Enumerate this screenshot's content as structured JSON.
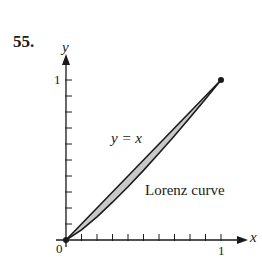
{
  "problem_number": "55.",
  "chart_data": {
    "type": "line",
    "title": "",
    "xlabel": "x",
    "ylabel": "y",
    "xlim": [
      0,
      1
    ],
    "ylim": [
      0,
      1
    ],
    "grid": false,
    "x_ticks": {
      "count": 10,
      "step": 0.1,
      "labels": {
        "0": "0",
        "1": "1"
      }
    },
    "y_ticks": {
      "count": 10,
      "step": 0.1,
      "labels": {
        "1": "1"
      }
    },
    "series": [
      {
        "name": "y = x",
        "x": [
          0,
          0.1,
          0.2,
          0.3,
          0.4,
          0.5,
          0.6,
          0.7,
          0.8,
          0.9,
          1.0
        ],
        "y": [
          0,
          0.1,
          0.2,
          0.3,
          0.4,
          0.5,
          0.6,
          0.7,
          0.8,
          0.9,
          1.0
        ]
      },
      {
        "name": "Lorenz curve",
        "x": [
          0,
          0.1,
          0.2,
          0.3,
          0.4,
          0.5,
          0.6,
          0.7,
          0.8,
          0.9,
          1.0
        ],
        "y": [
          0,
          0.063,
          0.145,
          0.236,
          0.333,
          0.435,
          0.542,
          0.652,
          0.765,
          0.881,
          1.0
        ]
      }
    ],
    "shaded_region": {
      "between": [
        "y = x",
        "Lorenz curve"
      ],
      "color": "#c8c8c8"
    },
    "endpoints": [
      [
        0,
        0
      ],
      [
        1,
        1
      ]
    ],
    "annotations": [
      {
        "text": "y = x",
        "at": [
          0.3,
          0.6
        ]
      },
      {
        "text": "Lorenz curve",
        "at": [
          0.5,
          0.27
        ]
      }
    ]
  },
  "labels": {
    "y_axis": "y",
    "x_axis": "x",
    "y_one": "1",
    "x_one": "1",
    "origin": "0",
    "line_annotation": "y = x",
    "curve_annotation": "Lorenz curve"
  },
  "colors": {
    "ink": "#1a1a1a",
    "shade": "#c8c8c8",
    "background": "#ffffff"
  }
}
